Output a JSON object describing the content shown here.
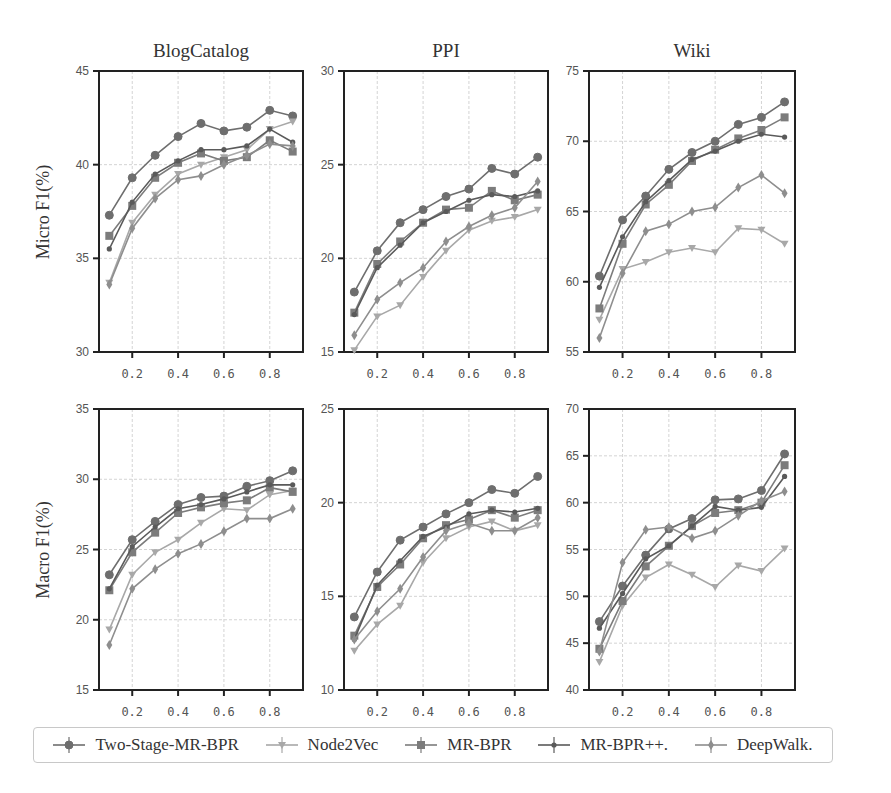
{
  "figure": {
    "row_labels": [
      "Micro F1(%)",
      "Macro F1(%)"
    ],
    "column_titles": [
      "BlogCatalog",
      "PPI",
      "Wiki"
    ]
  },
  "legend": {
    "items": [
      {
        "label": "Two-Stage-MR-BPR",
        "marker": "circle",
        "color": "#6e6e6e"
      },
      {
        "label": "Node2Vec",
        "marker": "triangle-down",
        "color": "#a8a8a8"
      },
      {
        "label": "MR-BPR",
        "marker": "square",
        "color": "#7c7c7c"
      },
      {
        "label": "MR-BPR++.",
        "marker": "dot",
        "color": "#5a5a5a"
      },
      {
        "label": "DeepWalk.",
        "marker": "diamond",
        "color": "#8e8e8e"
      }
    ]
  },
  "chart_data": [
    {
      "type": "line",
      "title": "BlogCatalog",
      "ylabel": "Micro F1(%)",
      "xlabel": "",
      "x": [
        0.1,
        0.2,
        0.3,
        0.4,
        0.5,
        0.6,
        0.7,
        0.8,
        0.9
      ],
      "xticks": [
        "0.2",
        "0.4",
        "0.6",
        "0.8"
      ],
      "ylim": [
        30,
        45
      ],
      "yticks": [
        30,
        35,
        40,
        45
      ],
      "grid": true,
      "series": [
        {
          "name": "Two-Stage-MR-BPR",
          "values": [
            37.3,
            39.3,
            40.5,
            41.5,
            42.2,
            41.8,
            42.0,
            42.9,
            42.6
          ]
        },
        {
          "name": "Node2Vec",
          "values": [
            33.7,
            36.9,
            38.4,
            39.5,
            40.0,
            40.4,
            40.8,
            41.9,
            42.3
          ]
        },
        {
          "name": "MR-BPR",
          "values": [
            36.2,
            37.8,
            39.3,
            40.1,
            40.6,
            40.2,
            40.4,
            41.3,
            40.7
          ]
        },
        {
          "name": "MR-BPR++.",
          "values": [
            35.5,
            38.0,
            39.5,
            40.2,
            40.8,
            40.8,
            41.0,
            41.9,
            41.2
          ]
        },
        {
          "name": "DeepWalk.",
          "values": [
            33.6,
            36.6,
            38.2,
            39.2,
            39.4,
            40.0,
            40.5,
            41.1,
            41.0
          ]
        }
      ]
    },
    {
      "type": "line",
      "title": "PPI",
      "ylabel": "",
      "xlabel": "",
      "x": [
        0.1,
        0.2,
        0.3,
        0.4,
        0.5,
        0.6,
        0.7,
        0.8,
        0.9
      ],
      "xticks": [
        "0.2",
        "0.4",
        "0.6",
        "0.8"
      ],
      "ylim": [
        15,
        30
      ],
      "yticks": [
        15,
        20,
        25,
        30
      ],
      "grid": true,
      "series": [
        {
          "name": "Two-Stage-MR-BPR",
          "values": [
            18.2,
            20.4,
            21.9,
            22.6,
            23.3,
            23.7,
            24.8,
            24.5,
            25.4
          ]
        },
        {
          "name": "Node2Vec",
          "values": [
            15.1,
            16.9,
            17.5,
            19.0,
            20.4,
            21.5,
            22.0,
            22.2,
            22.6
          ]
        },
        {
          "name": "MR-BPR",
          "values": [
            17.1,
            19.7,
            20.9,
            21.9,
            22.6,
            22.7,
            23.6,
            23.1,
            23.4
          ]
        },
        {
          "name": "MR-BPR++.",
          "values": [
            17.0,
            19.5,
            20.7,
            21.9,
            22.5,
            23.1,
            23.4,
            23.3,
            23.6
          ]
        },
        {
          "name": "DeepWalk.",
          "values": [
            15.9,
            17.8,
            18.7,
            19.5,
            20.9,
            21.7,
            22.3,
            22.7,
            24.1
          ]
        }
      ]
    },
    {
      "type": "line",
      "title": "Wiki",
      "ylabel": "",
      "xlabel": "",
      "x": [
        0.1,
        0.2,
        0.3,
        0.4,
        0.5,
        0.6,
        0.7,
        0.8,
        0.9
      ],
      "xticks": [
        "0.2",
        "0.4",
        "0.6",
        "0.8"
      ],
      "ylim": [
        55,
        75
      ],
      "yticks": [
        55,
        60,
        65,
        70,
        75
      ],
      "grid": true,
      "series": [
        {
          "name": "Two-Stage-MR-BPR",
          "values": [
            60.4,
            64.4,
            66.1,
            68.0,
            69.2,
            70.0,
            71.2,
            71.7,
            72.8
          ]
        },
        {
          "name": "Node2Vec",
          "values": [
            57.3,
            60.9,
            61.4,
            62.1,
            62.4,
            62.1,
            63.8,
            63.7,
            62.7
          ]
        },
        {
          "name": "MR-BPR",
          "values": [
            58.1,
            62.7,
            65.5,
            66.9,
            68.6,
            69.4,
            70.2,
            70.8,
            71.7
          ]
        },
        {
          "name": "MR-BPR++.",
          "values": [
            59.6,
            63.2,
            65.7,
            67.2,
            68.7,
            69.3,
            70.0,
            70.5,
            70.3
          ]
        },
        {
          "name": "DeepWalk.",
          "values": [
            56.0,
            60.6,
            63.6,
            64.1,
            65.0,
            65.3,
            66.7,
            67.6,
            66.3
          ]
        }
      ]
    },
    {
      "type": "line",
      "title": "BlogCatalog",
      "ylabel": "Macro F1(%)",
      "xlabel": "",
      "x": [
        0.1,
        0.2,
        0.3,
        0.4,
        0.5,
        0.6,
        0.7,
        0.8,
        0.9
      ],
      "xticks": [
        "0.2",
        "0.4",
        "0.6",
        "0.8"
      ],
      "ylim": [
        15,
        35
      ],
      "yticks": [
        15,
        20,
        25,
        30,
        35
      ],
      "grid": true,
      "series": [
        {
          "name": "Two-Stage-MR-BPR",
          "values": [
            23.2,
            25.7,
            27.0,
            28.2,
            28.7,
            28.8,
            29.5,
            29.9,
            30.6
          ]
        },
        {
          "name": "Node2Vec",
          "values": [
            19.3,
            23.2,
            24.8,
            25.7,
            26.9,
            27.9,
            27.8,
            28.9,
            29.2
          ]
        },
        {
          "name": "MR-BPR",
          "values": [
            22.1,
            24.8,
            26.2,
            27.6,
            28.0,
            28.3,
            28.5,
            29.4,
            29.1
          ]
        },
        {
          "name": "MR-BPR++.",
          "values": [
            22.2,
            25.2,
            26.6,
            27.9,
            28.2,
            28.6,
            29.1,
            29.6,
            29.6
          ]
        },
        {
          "name": "DeepWalk.",
          "values": [
            18.2,
            22.2,
            23.6,
            24.7,
            25.4,
            26.3,
            27.2,
            27.2,
            27.9
          ]
        }
      ]
    },
    {
      "type": "line",
      "title": "PPI",
      "ylabel": "",
      "xlabel": "",
      "x": [
        0.1,
        0.2,
        0.3,
        0.4,
        0.5,
        0.6,
        0.7,
        0.8,
        0.9
      ],
      "xticks": [
        "0.2",
        "0.4",
        "0.6",
        "0.8"
      ],
      "ylim": [
        10,
        25
      ],
      "yticks": [
        10,
        15,
        20,
        25
      ],
      "grid": true,
      "series": [
        {
          "name": "Two-Stage-MR-BPR",
          "values": [
            13.9,
            16.3,
            18.0,
            18.7,
            19.4,
            20.0,
            20.7,
            20.5,
            21.4
          ]
        },
        {
          "name": "Node2Vec",
          "values": [
            12.1,
            13.5,
            14.5,
            16.8,
            18.1,
            18.7,
            19.0,
            18.5,
            18.8
          ]
        },
        {
          "name": "MR-BPR",
          "values": [
            12.9,
            15.5,
            16.7,
            18.1,
            18.8,
            19.1,
            19.6,
            19.2,
            19.6
          ]
        },
        {
          "name": "MR-BPR++.",
          "values": [
            12.7,
            15.6,
            16.9,
            18.2,
            18.7,
            19.4,
            19.6,
            19.5,
            19.7
          ]
        },
        {
          "name": "DeepWalk.",
          "values": [
            12.7,
            14.2,
            15.4,
            17.1,
            18.5,
            18.9,
            18.5,
            18.5,
            19.2
          ]
        }
      ]
    },
    {
      "type": "line",
      "title": "Wiki",
      "ylabel": "",
      "xlabel": "",
      "x": [
        0.1,
        0.2,
        0.3,
        0.4,
        0.5,
        0.6,
        0.7,
        0.8,
        0.9
      ],
      "xticks": [
        "0.2",
        "0.4",
        "0.6",
        "0.8"
      ],
      "ylim": [
        40,
        70
      ],
      "yticks": [
        40,
        45,
        50,
        55,
        60,
        65,
        70
      ],
      "grid": true,
      "series": [
        {
          "name": "Two-Stage-MR-BPR",
          "values": [
            47.3,
            51.1,
            54.4,
            57.2,
            58.3,
            60.3,
            60.4,
            61.3,
            65.2
          ]
        },
        {
          "name": "Node2Vec",
          "values": [
            43.0,
            49.0,
            52.0,
            53.4,
            52.3,
            51.0,
            53.3,
            52.7,
            55.1
          ]
        },
        {
          "name": "MR-BPR",
          "values": [
            44.4,
            49.5,
            53.2,
            55.4,
            57.5,
            58.9,
            59.2,
            60.0,
            64.0
          ]
        },
        {
          "name": "MR-BPR++.",
          "values": [
            46.6,
            50.3,
            54.0,
            55.4,
            57.5,
            59.6,
            59.2,
            59.5,
            62.8
          ]
        },
        {
          "name": "DeepWalk.",
          "values": [
            44.1,
            53.6,
            57.1,
            57.4,
            56.2,
            57.0,
            58.6,
            60.2,
            61.2
          ]
        }
      ]
    }
  ]
}
